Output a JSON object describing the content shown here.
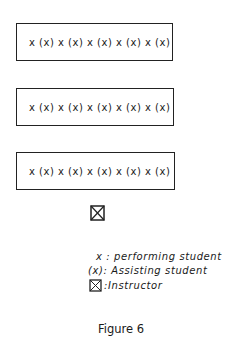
{
  "rows": [
    {
      "content": "x (x) x (x) x (x) x (x) x (x)"
    },
    {
      "content": "x (x) x (x) x (x) x (x) x (x)"
    },
    {
      "content": "x (x) x (x) x (x) x (x) x (x)"
    }
  ],
  "instructor_symbol": "boxed-x",
  "legend": {
    "performing": "x : performing student",
    "assisting": "(x): Assisting student",
    "instructor": ":Instructor"
  },
  "caption": "Figure 6"
}
